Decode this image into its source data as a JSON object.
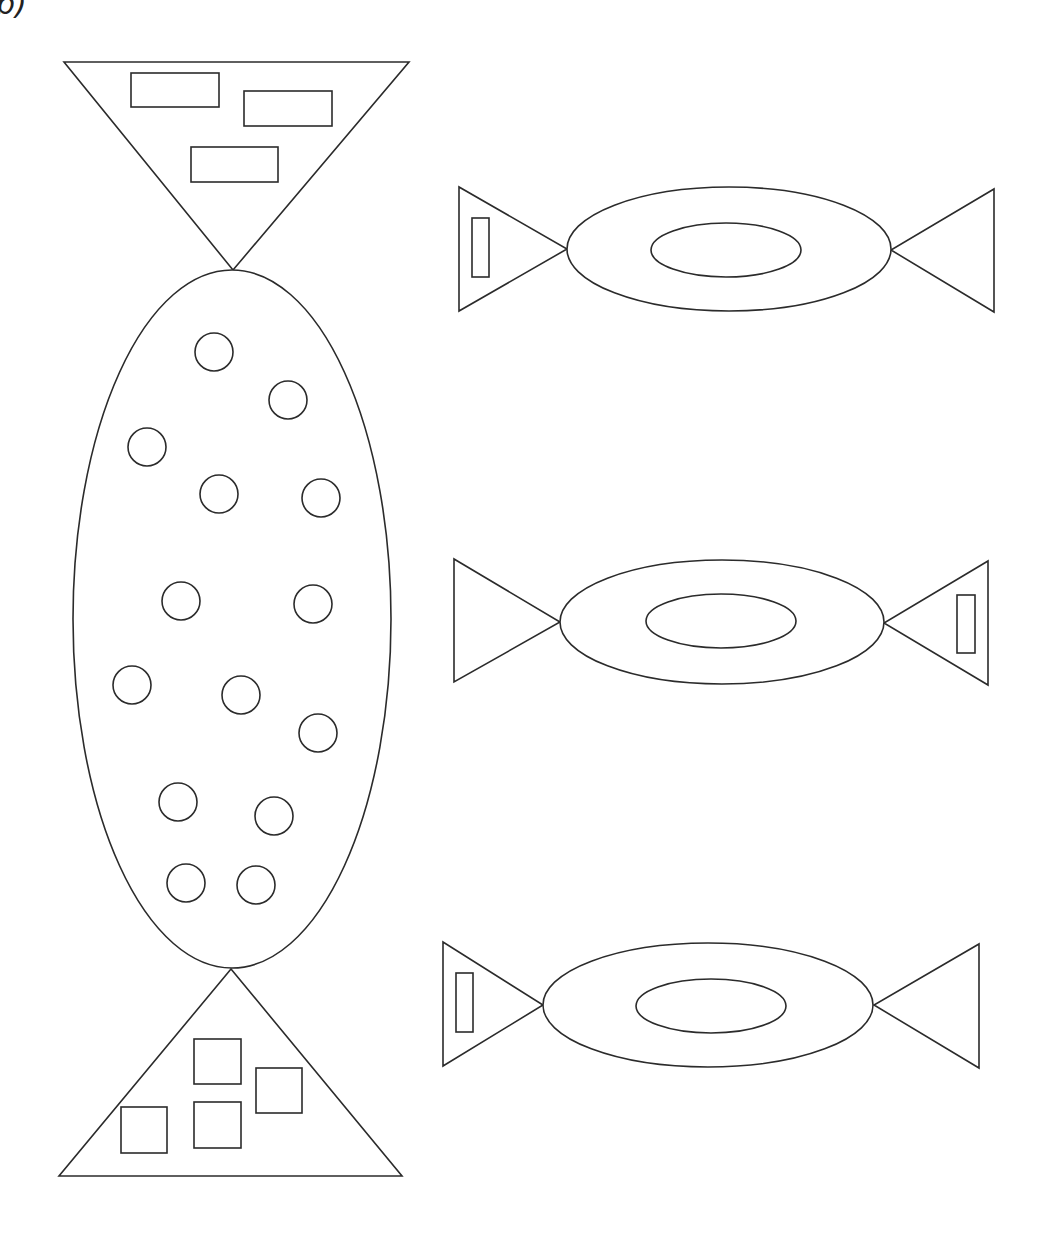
{
  "figure": {
    "label": "b)",
    "stroke_color": "#2b2b2b",
    "background": "#ffffff"
  },
  "large_candy": {
    "top_wrapper": {
      "shape": "triangle-down",
      "points": [
        [
          64,
          62
        ],
        [
          409,
          62
        ],
        [
          233,
          270
        ]
      ],
      "rectangles": [
        {
          "x": 131,
          "y": 73,
          "w": 88,
          "h": 34
        },
        {
          "x": 244,
          "y": 91,
          "w": 88,
          "h": 35
        },
        {
          "x": 191,
          "y": 147,
          "w": 87,
          "h": 35
        }
      ]
    },
    "body": {
      "shape": "ellipse",
      "cx": 232,
      "cy": 619,
      "rx": 159,
      "ry": 349,
      "circles": [
        {
          "cx": 214,
          "cy": 352,
          "r": 19
        },
        {
          "cx": 288,
          "cy": 400,
          "r": 19
        },
        {
          "cx": 147,
          "cy": 447,
          "r": 19
        },
        {
          "cx": 219,
          "cy": 494,
          "r": 19
        },
        {
          "cx": 321,
          "cy": 498,
          "r": 19
        },
        {
          "cx": 181,
          "cy": 601,
          "r": 19
        },
        {
          "cx": 313,
          "cy": 604,
          "r": 19
        },
        {
          "cx": 132,
          "cy": 685,
          "r": 19
        },
        {
          "cx": 241,
          "cy": 695,
          "r": 19
        },
        {
          "cx": 318,
          "cy": 733,
          "r": 19
        },
        {
          "cx": 178,
          "cy": 802,
          "r": 19
        },
        {
          "cx": 274,
          "cy": 816,
          "r": 19
        },
        {
          "cx": 186,
          "cy": 883,
          "r": 19
        },
        {
          "cx": 256,
          "cy": 885,
          "r": 19
        }
      ]
    },
    "bottom_wrapper": {
      "shape": "triangle-up",
      "points": [
        [
          231,
          969
        ],
        [
          59,
          1176
        ],
        [
          402,
          1176
        ]
      ],
      "squares": [
        {
          "x": 194,
          "y": 1039,
          "w": 47,
          "h": 45
        },
        {
          "x": 256,
          "y": 1068,
          "w": 46,
          "h": 45
        },
        {
          "x": 194,
          "y": 1102,
          "w": 47,
          "h": 46
        },
        {
          "x": 121,
          "y": 1107,
          "w": 46,
          "h": 46
        }
      ]
    }
  },
  "small_candies": [
    {
      "name": "candy-1",
      "left_wrapper": [
        [
          459,
          187
        ],
        [
          459,
          311
        ],
        [
          567,
          249
        ]
      ],
      "right_wrapper": [
        [
          994,
          189
        ],
        [
          994,
          312
        ],
        [
          891,
          250
        ]
      ],
      "outer": {
        "cx": 729,
        "cy": 249,
        "rx": 162,
        "ry": 62
      },
      "inner": {
        "cx": 726,
        "cy": 250,
        "rx": 75,
        "ry": 27
      },
      "tag": {
        "side": "left",
        "x": 472,
        "y": 218,
        "w": 17,
        "h": 59
      }
    },
    {
      "name": "candy-2",
      "left_wrapper": [
        [
          454,
          559
        ],
        [
          454,
          682
        ],
        [
          560,
          622
        ]
      ],
      "right_wrapper": [
        [
          988,
          561
        ],
        [
          988,
          685
        ],
        [
          884,
          623
        ]
      ],
      "outer": {
        "cx": 722,
        "cy": 622,
        "rx": 162,
        "ry": 62
      },
      "inner": {
        "cx": 721,
        "cy": 621,
        "rx": 75,
        "ry": 27
      },
      "tag": {
        "side": "right",
        "x": 957,
        "y": 595,
        "w": 18,
        "h": 58
      }
    },
    {
      "name": "candy-3",
      "left_wrapper": [
        [
          443,
          942
        ],
        [
          443,
          1066
        ],
        [
          543,
          1005
        ]
      ],
      "right_wrapper": [
        [
          979,
          944
        ],
        [
          979,
          1068
        ],
        [
          874,
          1005
        ]
      ],
      "outer": {
        "cx": 708,
        "cy": 1005,
        "rx": 165,
        "ry": 62
      },
      "inner": {
        "cx": 711,
        "cy": 1006,
        "rx": 75,
        "ry": 27
      },
      "tag": {
        "side": "left",
        "x": 456,
        "y": 973,
        "w": 17,
        "h": 59
      }
    }
  ]
}
